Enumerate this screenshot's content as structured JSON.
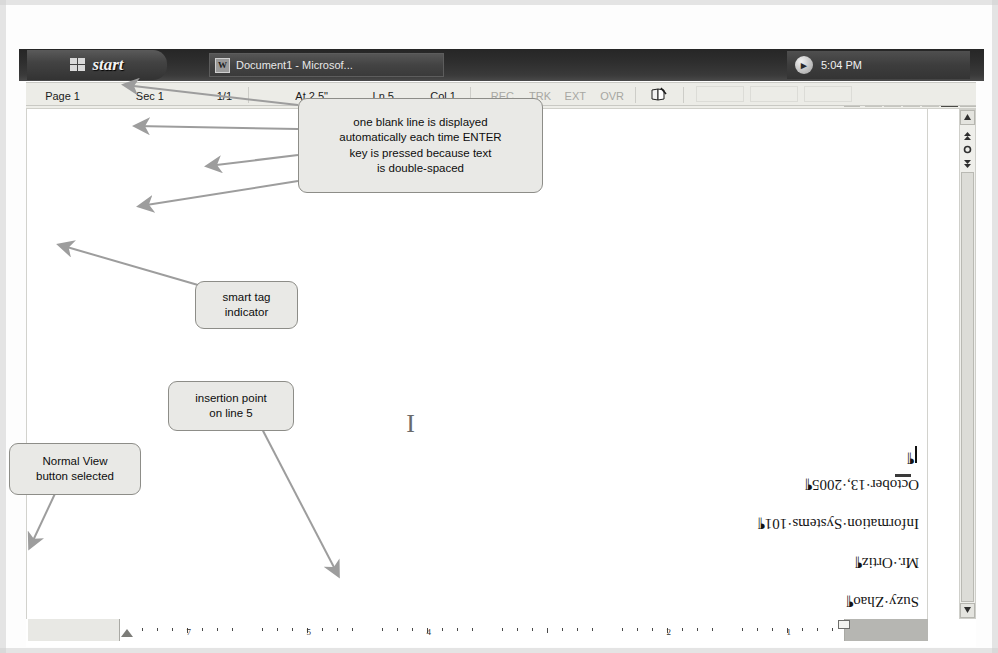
{
  "taskbar": {
    "start_label": "start",
    "task_item_label": "Document1 - Microsof...",
    "clock": "5:04 PM",
    "tray_chevron_icon": "chevron-right-icon",
    "word_icon": "word-document-icon",
    "windows_flag_icon": "windows-flag-icon"
  },
  "statusbar": {
    "page": "Page 1",
    "section": "Sec 1",
    "pages": "1/1",
    "at": "At 2.5\"",
    "line": "Ln 5",
    "column": "Col 1",
    "modes": [
      "REC",
      "TRK",
      "EXT",
      "OVR"
    ],
    "spelling_icon": "spelling-and-grammar-check-icon"
  },
  "document": {
    "lines": [
      "Suzy·Zhao¶",
      "Mr.·Ortiz¶",
      "Information·Systems·101¶",
      "October·13,·2005¶"
    ],
    "insertion_point_paragraph_mark": "¶",
    "mouse_pointer_icon": "i-beam-pointer-icon"
  },
  "ruler": {
    "numbers": [
      "1",
      "2",
      "4",
      "5",
      "7"
    ],
    "left_indent_icon": "left-indent-marker-icon",
    "first_line_indent_icon": "first-line-indent-marker-icon"
  },
  "view_buttons": [
    {
      "name": "normal-view",
      "icon": "normal-view-icon",
      "selected": true
    },
    {
      "name": "web-layout-view",
      "icon": "web-layout-view-icon",
      "selected": false
    },
    {
      "name": "print-layout-view",
      "icon": "print-layout-view-icon",
      "selected": false
    },
    {
      "name": "outline-view",
      "icon": "outline-view-icon",
      "selected": false
    },
    {
      "name": "reading-layout-view",
      "icon": "reading-layout-view-icon",
      "selected": false
    }
  ],
  "scrollbar": {
    "up_arrow_icon": "scroll-up-arrow-icon",
    "down_arrow_icon": "scroll-down-arrow-icon",
    "previous_object_icon": "previous-object-icon",
    "select_browse_object_icon": "select-browse-object-icon",
    "next_object_icon": "next-object-icon",
    "left_arrow_icon": "scroll-left-arrow-icon",
    "right_arrow_icon": "scroll-right-arrow-icon"
  },
  "callouts": {
    "normal_view": "Normal View\nbutton selected",
    "insertion_point": "insertion point\non line 5",
    "smart_tag": "smart tag\nindicator",
    "blank_line": "one blank line is displayed\nautomatically each time ENTER\nkey is pressed because text\nis double-spaced"
  },
  "colors": {
    "callout_fill": "#e9e9e6",
    "callout_border": "#8d8d88",
    "arrow": "#9a9a9a",
    "taskbar": "#2e2e2e",
    "statusbar": "#ececE7"
  }
}
